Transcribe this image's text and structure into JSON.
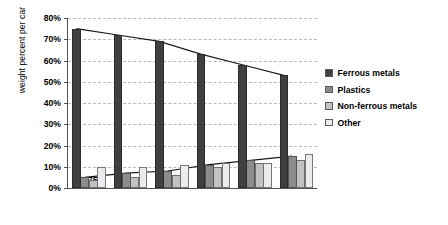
{
  "chart_data": {
    "type": "bar",
    "title": "",
    "xlabel": "",
    "ylabel": "weight percent per car",
    "categories": [
      "1975",
      "1980",
      "1985",
      "1995",
      "2000",
      "2005"
    ],
    "ylim": [
      0,
      80
    ],
    "ytick_labels": [
      "0%",
      "10%",
      "20%",
      "30%",
      "40%",
      "50%",
      "60%",
      "70%",
      "80%"
    ],
    "ytick_values": [
      0,
      10,
      20,
      30,
      40,
      50,
      60,
      70,
      80
    ],
    "grid": true,
    "legend_position": "right",
    "series": [
      {
        "name": "Ferrous metals",
        "color": "#404040",
        "values": [
          75,
          72,
          69,
          63,
          58,
          53
        ]
      },
      {
        "name": "Plastics",
        "color": "#8c8c8c",
        "values": [
          5,
          7,
          8,
          11,
          13,
          15
        ]
      },
      {
        "name": "Non-ferrous metals",
        "color": "#c2c2c2",
        "values": [
          4,
          5,
          6,
          10,
          12,
          13
        ]
      },
      {
        "name": "Other",
        "color": "#ececec",
        "values": [
          10,
          10,
          11,
          12,
          12,
          16
        ]
      }
    ],
    "trend_lines": [
      {
        "name": "ferrous-trend",
        "series": "Ferrous metals",
        "values": [
          75,
          72,
          69,
          63,
          58,
          53
        ]
      },
      {
        "name": "plastics-trend",
        "series": "Plastics",
        "values": [
          5,
          7,
          8,
          11,
          13,
          15
        ]
      }
    ]
  }
}
